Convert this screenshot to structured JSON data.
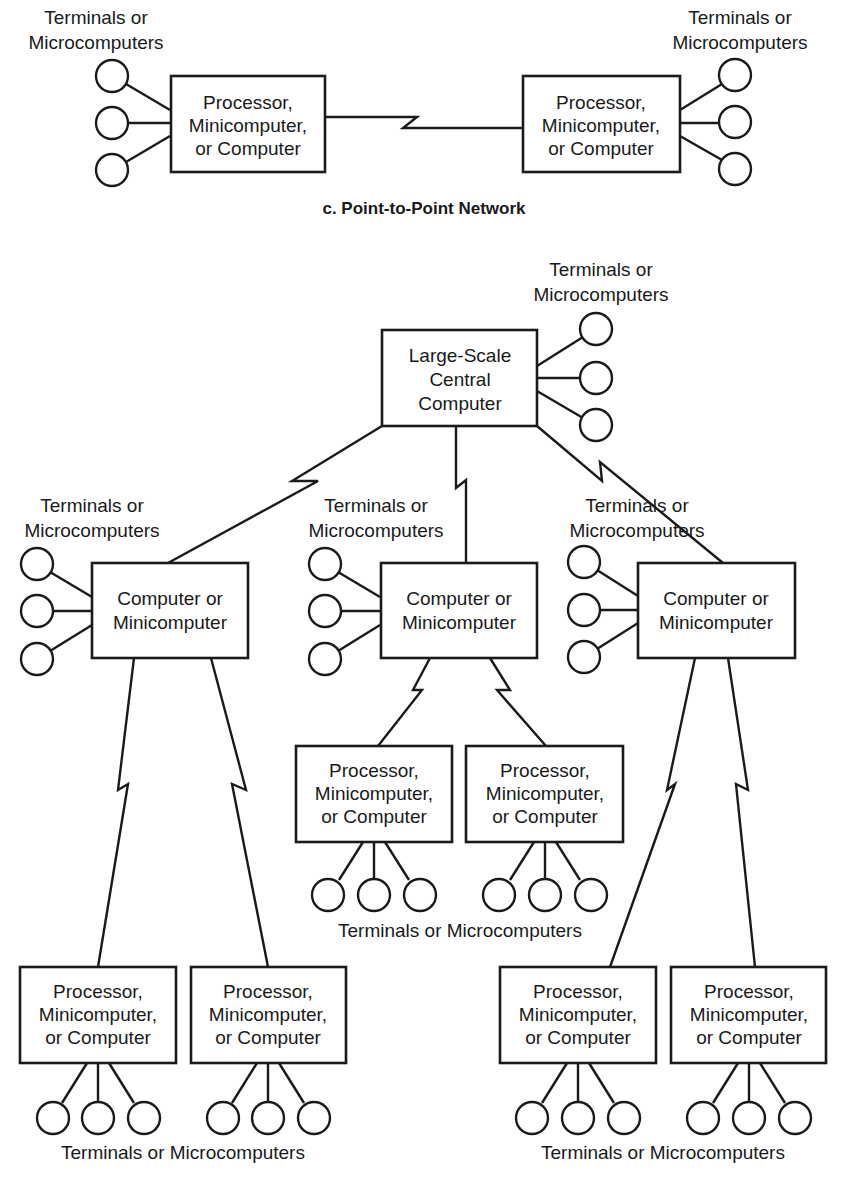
{
  "diagram": {
    "point_to_point": {
      "caption": "c. Point-to-Point Network",
      "left_terminals_label": [
        "Terminals or",
        "Microcomputers"
      ],
      "right_terminals_label": [
        "Terminals or",
        "Microcomputers"
      ],
      "left_node": [
        "Processor,",
        "Minicomputer,",
        "or Computer"
      ],
      "right_node": [
        "Processor,",
        "Minicomputer,",
        "or Computer"
      ]
    },
    "hierarchical": {
      "central": [
        "Large-Scale",
        "Central",
        "Computer"
      ],
      "central_terminals_label": [
        "Terminals or",
        "Microcomputers"
      ],
      "mid_nodes": [
        {
          "text": [
            "Computer or",
            "Minicomputer"
          ],
          "terminals_label": [
            "Terminals or",
            "Microcomputers"
          ]
        },
        {
          "text": [
            "Computer or",
            "Minicomputer"
          ],
          "terminals_label": [
            "Terminals or",
            "Microcomputers"
          ]
        },
        {
          "text": [
            "Computer or",
            "Minicomputer"
          ],
          "terminals_label": [
            "Terminals or",
            "Microcomputers"
          ]
        }
      ],
      "center_leaf_nodes": [
        [
          "Processor,",
          "Minicomputer,",
          "or Computer"
        ],
        [
          "Processor,",
          "Minicomputer,",
          "or Computer"
        ]
      ],
      "center_leaf_terminals_label": "Terminals or Microcomputers",
      "left_leaf_nodes": [
        [
          "Processor,",
          "Minicomputer,",
          "or Computer"
        ],
        [
          "Processor,",
          "Minicomputer,",
          "or Computer"
        ]
      ],
      "left_leaf_terminals_label": "Terminals or Microcomputers",
      "right_leaf_nodes": [
        [
          "Processor,",
          "Minicomputer,",
          "or Computer"
        ],
        [
          "Processor,",
          "Minicomputer,",
          "or Computer"
        ]
      ],
      "right_leaf_terminals_label": "Terminals or Microcomputers"
    }
  }
}
